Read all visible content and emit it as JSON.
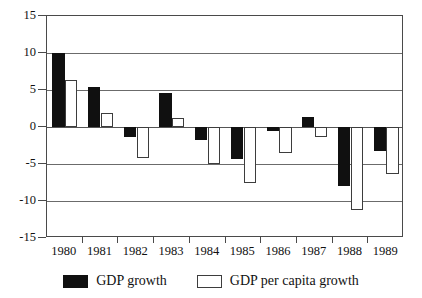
{
  "chart_data": {
    "type": "bar",
    "title": "",
    "subtitle": "",
    "xlabel": "",
    "ylabel": "",
    "categories": [
      "1980",
      "1981",
      "1982",
      "1983",
      "1984",
      "1985",
      "1986",
      "1987",
      "1988",
      "1989"
    ],
    "series": [
      {
        "name": "GDP growth",
        "color": "#101010",
        "values": [
          10.0,
          5.4,
          -1.3,
          4.6,
          -1.7,
          -4.3,
          -0.5,
          1.4,
          -8.0,
          -3.2
        ]
      },
      {
        "name": "GDP per capita growth",
        "color": "#ffffff",
        "values": [
          6.4,
          1.9,
          -4.2,
          1.2,
          -5.0,
          -7.5,
          -3.5,
          -1.4,
          -11.2,
          -6.3
        ]
      }
    ],
    "ylim": [
      -15,
      15
    ],
    "yticks": [
      15,
      10,
      5,
      0,
      -5,
      -10,
      -15
    ],
    "ytick_labels": [
      "15",
      "10",
      "5",
      "0",
      "-5",
      "-10",
      "-15"
    ],
    "grid": true,
    "grid_axis": "y",
    "legend_position": "bottom",
    "zero_line": 0
  },
  "legend": {
    "entries": [
      {
        "label": "GDP growth",
        "swatch": "black"
      },
      {
        "label": "GDP per capita growth",
        "swatch": "white"
      }
    ]
  }
}
